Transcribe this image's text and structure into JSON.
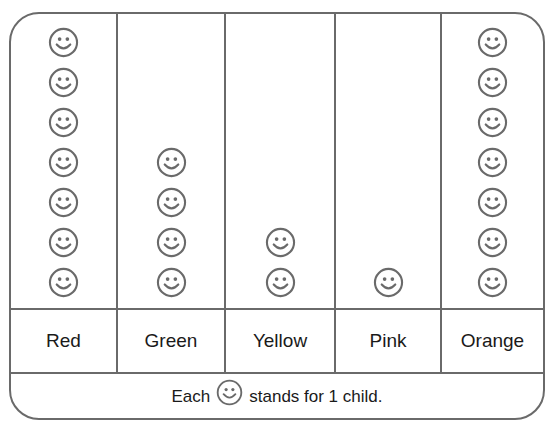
{
  "chart_data": {
    "type": "pictograph",
    "title": "",
    "categories": [
      "Red",
      "Green",
      "Yellow",
      "Pink",
      "Orange"
    ],
    "values": [
      7,
      4,
      2,
      1,
      7
    ],
    "symbol": "smiley-face",
    "key": "Each ☺ stands for 1 child.",
    "units_per_symbol": 1,
    "xlabel": "",
    "ylabel": ""
  },
  "key": {
    "prefix": "Each",
    "suffix": "stands for 1 child."
  },
  "colors": {
    "line": "#6a6a6a",
    "text": "#1a1a1a",
    "background": "#ffffff"
  }
}
